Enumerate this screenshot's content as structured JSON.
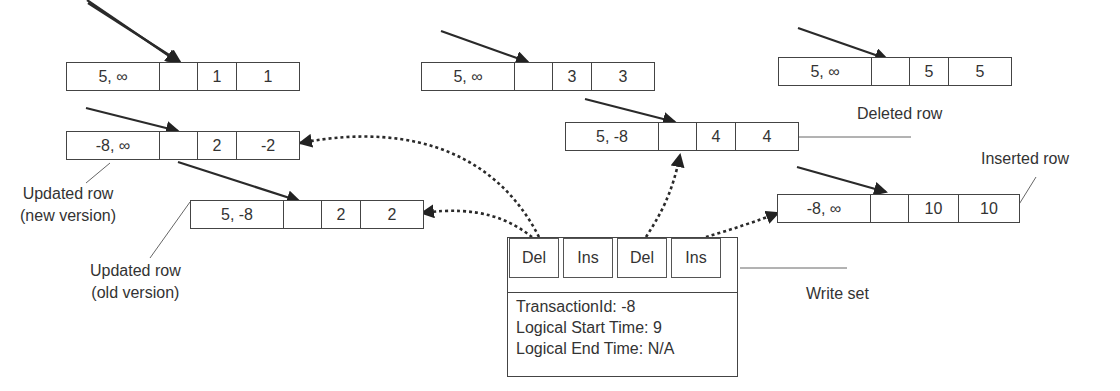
{
  "diagram": {
    "type": "in-memory MVCC row versions with transaction write set",
    "rows": [
      {
        "id": "row1",
        "timestamps": "5, ∞",
        "pointer": "",
        "col1": "1",
        "col2": "1"
      },
      {
        "id": "row3",
        "timestamps": "5, ∞",
        "pointer": "",
        "col1": "3",
        "col2": "3"
      },
      {
        "id": "row5",
        "timestamps": "5, ∞",
        "pointer": "",
        "col1": "5",
        "col2": "5"
      },
      {
        "id": "row2-new",
        "timestamps": "-8, ∞",
        "pointer": "",
        "col1": "2",
        "col2": "-2"
      },
      {
        "id": "row4-deleted",
        "timestamps": "5, -8",
        "pointer": "",
        "col1": "4",
        "col2": "4"
      },
      {
        "id": "row2-old",
        "timestamps": "5, -8",
        "pointer": "",
        "col1": "2",
        "col2": "2"
      },
      {
        "id": "row10-inserted",
        "timestamps": "-8, ∞",
        "pointer": "",
        "col1": "10",
        "col2": "10"
      }
    ],
    "labels": {
      "updated_new_line1": "Updated row",
      "updated_new_line2": "(new version)",
      "updated_old_line1": "Updated row",
      "updated_old_line2": "(old version)",
      "deleted": "Deleted row",
      "inserted": "Inserted row",
      "write_set": "Write set"
    },
    "write_set": {
      "operations": [
        "Del",
        "Ins",
        "Del",
        "Ins"
      ],
      "transaction_id": "TransactionId: -8",
      "logical_start_time": "Logical Start Time: 9",
      "logical_end_time": "Logical End Time: N/A"
    },
    "colors": {
      "stroke": "#333333",
      "text": "#333333",
      "background": "#ffffff"
    }
  }
}
